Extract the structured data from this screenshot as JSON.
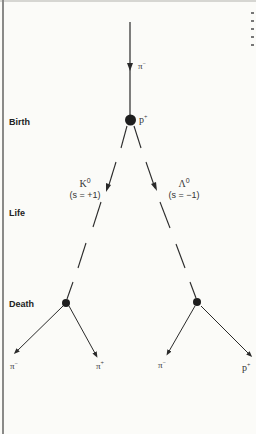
{
  "stages": {
    "birth": "Birth",
    "life": "Life",
    "death": "Death"
  },
  "particles": {
    "incoming": {
      "symbol": "π",
      "charge": "−"
    },
    "target": {
      "symbol": "p",
      "charge": "+"
    },
    "kaon": {
      "name": "K",
      "superscript": "0",
      "strangeness": "(s = +1)"
    },
    "lambda": {
      "name": "Λ",
      "superscript": "0",
      "strangeness": "(s = −1)"
    },
    "kaon_decay": [
      {
        "symbol": "π",
        "charge": "−"
      },
      {
        "symbol": "π",
        "charge": "+"
      }
    ],
    "lambda_decay": [
      {
        "symbol": "π",
        "charge": "−"
      },
      {
        "symbol": "p",
        "charge": "+"
      }
    ]
  },
  "colors": {
    "ink": "#2a2a2a",
    "background": "#fbfbf8",
    "page_edge": "#8a8a88"
  }
}
